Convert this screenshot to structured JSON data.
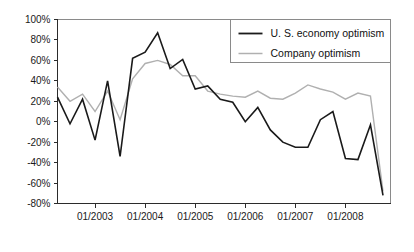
{
  "chart_data": {
    "type": "line",
    "title": "",
    "xlabel": "",
    "ylabel": "",
    "ylim": [
      -80,
      100
    ],
    "ytick_labels": [
      "100%",
      "80%",
      "60%",
      "40%",
      "20%",
      "0%",
      "-20%",
      "-40%",
      "-60%",
      "-80%"
    ],
    "ytick_values": [
      100,
      80,
      60,
      40,
      20,
      0,
      -20,
      -40,
      -60,
      -80
    ],
    "xtick_labels": [
      "01/2003",
      "01/2004",
      "01/2005",
      "01/2006",
      "01/2007",
      "01/2008"
    ],
    "xtick_values": [
      2003.0,
      2004.0,
      2005.0,
      2006.0,
      2007.0,
      2008.0
    ],
    "xlim": [
      2002.25,
      2008.9
    ],
    "grid": false,
    "legend_position": "top-right",
    "x": [
      2002.25,
      2002.5,
      2002.75,
      2003.0,
      2003.25,
      2003.5,
      2003.75,
      2004.0,
      2004.25,
      2004.5,
      2004.75,
      2005.0,
      2005.25,
      2005.5,
      2005.75,
      2006.0,
      2006.25,
      2006.5,
      2006.75,
      2007.0,
      2007.25,
      2007.5,
      2007.75,
      2008.0,
      2008.25,
      2008.5,
      2008.75
    ],
    "series": [
      {
        "name": "U. S. economy optimism",
        "color": "#1a1a1a",
        "values": [
          24,
          -2,
          22,
          -18,
          40,
          -34,
          62,
          68,
          87,
          52,
          61,
          32,
          35,
          22,
          19,
          0,
          14,
          -8,
          -20,
          -25,
          -25,
          2,
          10,
          -36,
          -37,
          -3,
          -72
        ]
      },
      {
        "name": "Company optimism",
        "color": "#b0b0b0",
        "values": [
          34,
          20,
          27,
          10,
          30,
          2,
          42,
          57,
          60,
          56,
          45,
          45,
          30,
          27,
          25,
          24,
          30,
          23,
          22,
          28,
          36,
          32,
          29,
          22,
          28,
          25,
          -68
        ]
      }
    ]
  },
  "legend": {
    "entries": [
      {
        "label": "U. S. economy optimism"
      },
      {
        "label": "Company optimism"
      }
    ]
  }
}
